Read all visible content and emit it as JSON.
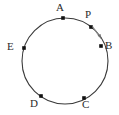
{
  "figure": {
    "type": "geometry-diagram",
    "background_color": "#ffffff",
    "stroke_color": "#3a3a3a",
    "point_color": "#111111",
    "label_color": "#2b2b2b",
    "circle": {
      "center_x": 65,
      "center_y": 61,
      "radius": 43
    },
    "points": [
      {
        "id": "A",
        "label": "A",
        "cx": 63,
        "cy": 18,
        "label_x": 59,
        "label_y": 3
      },
      {
        "id": "P",
        "label": "P",
        "cx": 91,
        "cy": 27,
        "label_x": 87,
        "label_y": 12
      },
      {
        "id": "B",
        "label": "B",
        "cx": 101,
        "cy": 46,
        "label_x": 105,
        "label_y": 40
      },
      {
        "id": "C",
        "label": "C",
        "cx": 84,
        "cy": 98,
        "label_x": 84,
        "label_y": 100
      },
      {
        "id": "D",
        "label": "D",
        "cx": 41,
        "cy": 96,
        "label_x": 31,
        "label_y": 100
      },
      {
        "id": "E",
        "label": "E",
        "cx": 24,
        "cy": 48,
        "label_x": 9,
        "label_y": 41
      }
    ],
    "arrow": {
      "id": "arrow-p-to-b",
      "from_x": 92,
      "from_y": 26,
      "to_x": 101,
      "to_y": 38,
      "direction": "clockwise-tangent-at-P",
      "color": "#777777"
    }
  }
}
